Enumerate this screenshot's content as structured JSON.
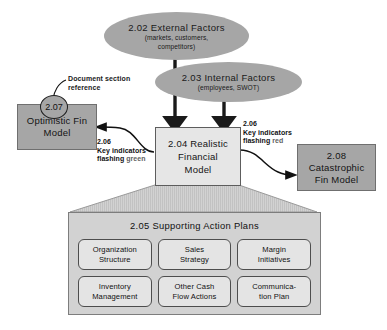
{
  "diagram": {
    "colors": {
      "solid_gray": "#a6a6a6",
      "light_gray": "#e6e6e6",
      "panel_gray": "#d2d2d2",
      "plan_box": "#e4e4e4",
      "line": "#1a1a1a",
      "background": "#ffffff"
    },
    "ellipses": [
      {
        "id": "external-factors",
        "title": "2.02 External Factors",
        "subtitle_line1": "(markets, customers,",
        "subtitle_line2": "competitors)"
      },
      {
        "id": "internal-factors",
        "title": "2.03 Internal Factors",
        "subtitle_line1": "(employees, SWOT)",
        "subtitle_line2": ""
      }
    ],
    "boxes": {
      "realistic": {
        "line1": "2.04 Realistic",
        "line2": "Financial",
        "line3": "Model"
      },
      "optimistic": {
        "line1": "Optimistic Fin",
        "line2": "Model",
        "badge": "2.07"
      },
      "catastrophic": {
        "line1": "2.08",
        "line2": "Catastrophic",
        "line3": "Fin Model"
      }
    },
    "callouts": {
      "doc_reference_line1": "Document section",
      "doc_reference_line2": "reference"
    },
    "indicators": {
      "green": {
        "number": "2.06",
        "line1": "Key indicators",
        "line2_prefix": "flashing ",
        "line2_state": "green"
      },
      "red": {
        "number": "2.06",
        "line1": "Key indicators",
        "line2_prefix": "flashing ",
        "line2_state": "red"
      }
    },
    "action_plans": {
      "title": "2.05 Supporting Action Plans",
      "items": [
        {
          "line1": "Organization",
          "line2": "Structure"
        },
        {
          "line1": "Sales",
          "line2": "Strategy"
        },
        {
          "line1": "Margin",
          "line2": "Initiatives"
        },
        {
          "line1": "Inventory",
          "line2": "Management"
        },
        {
          "line1": "Other Cash",
          "line2": "Flow Actions"
        },
        {
          "line1": "Communica-",
          "line2": "tion Plan"
        }
      ]
    }
  }
}
